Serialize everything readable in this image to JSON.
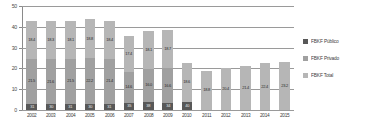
{
  "chart_data": {
    "type": "bar",
    "title": "",
    "subtitle": "",
    "xlabel": "",
    "ylabel": "",
    "stacked": true,
    "grid": true,
    "ylim": [
      0,
      50
    ],
    "yticks": [
      "0",
      "10",
      "20",
      "30",
      "40",
      "50"
    ],
    "legend_position": "right",
    "categories": [
      "2002",
      "2003",
      "2004",
      "2005",
      "2006",
      "2007",
      "2008",
      "2009",
      "2010",
      "2011",
      "2012",
      "2013",
      "2014",
      "2015"
    ],
    "series": [
      {
        "name": "FBKF Total",
        "color": "#b6b6b6",
        "values": [
          18.4,
          18.3,
          18.1,
          18.8,
          18.4,
          17.4,
          18.1,
          18.7,
          18.6,
          18.8,
          20.4,
          21.4,
          22.4,
          23.2
        ],
        "labels": [
          "18.4",
          "18.3",
          "18.1",
          "18.8",
          "18.4",
          "17.4",
          "18.1",
          "18.7",
          "18.6",
          "18.8",
          "20.4",
          "21.4",
          "22.4",
          "23.2"
        ]
      },
      {
        "name": "FBKF Privado",
        "color": "#a0a0a0",
        "values": [
          21.5,
          21.6,
          21.5,
          22.2,
          21.4,
          14.6,
          16.0,
          16.6,
          0,
          0,
          0,
          0,
          0,
          0
        ],
        "labels": [
          "21.5",
          "21.6",
          "21.5",
          "22.2",
          "21.4",
          "14.6",
          "16.0",
          "16.6",
          "",
          "",
          "",
          "",
          "",
          ""
        ]
      },
      {
        "name": "FBKF Público",
        "color": "#585858",
        "values": [
          3.1,
          2.7,
          3.1,
          2.7,
          3.1,
          3.5,
          3.9,
          3.4,
          4.0,
          0,
          0,
          0,
          0,
          0
        ],
        "labels": [
          "31",
          "30",
          "31",
          "30",
          "31",
          "35",
          "38",
          "34",
          "40",
          "",
          "",
          "",
          "",
          ""
        ]
      }
    ],
    "bar_totals": [
      31.0,
      29.5,
      31.0,
      30.0,
      31.0,
      34.0,
      38.0,
      34.0,
      30.0,
      18.8,
      20.4,
      21.4,
      22.4,
      23.2
    ]
  },
  "legend": {
    "items": [
      {
        "label": "FBKF Público",
        "color": "#585858"
      },
      {
        "label": "FBKF Privado",
        "color": "#a0a0a0"
      },
      {
        "label": "FBKF Total",
        "color": "#b6b6b6"
      }
    ]
  }
}
